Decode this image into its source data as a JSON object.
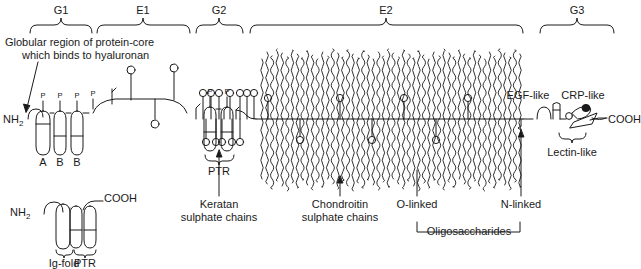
{
  "figure": {
    "type": "diagram",
    "background_color": "#ffffff",
    "line_color": "#1a1a1a"
  },
  "domain_braces": [
    {
      "label": "G1",
      "x1": 30,
      "x2": 93,
      "center": 61
    },
    {
      "label": "E1",
      "x1": 97,
      "x2": 190,
      "center": 143
    },
    {
      "label": "G2",
      "x1": 196,
      "x2": 243,
      "center": 219
    },
    {
      "label": "E2",
      "x1": 250,
      "x2": 523,
      "center": 386
    },
    {
      "label": "G3",
      "x1": 540,
      "x2": 614,
      "center": 577
    }
  ],
  "annotations": {
    "globular_note_line1": "Globular region of protein-core",
    "globular_note_line2": "which binds to hyaluronan",
    "keratan_line1": "Keratan",
    "keratan_line2": "sulphate chains",
    "chondroitin_line1": "Chondroitin",
    "chondroitin_line2": "sulphate chains",
    "o_linked": "O-linked",
    "n_linked": "N-linked",
    "oligosaccharides": "Oligosaccharides",
    "egf_like": "EGF-like",
    "crp_like": "CRP-like",
    "lectin_like": "Lectin-like"
  },
  "termini": {
    "n_terminus": "NH",
    "n_terminus_sub": "2",
    "c_terminus": "COOH"
  },
  "g1_loops": [
    {
      "label": "A",
      "x": 43
    },
    {
      "label": "B",
      "x": 60
    },
    {
      "label": "B",
      "x": 77
    }
  ],
  "ptr_labels": [
    {
      "label": "PTR",
      "x": 219,
      "y": 152
    },
    {
      "label": "PTR",
      "x": 75,
      "y": 244
    }
  ],
  "p_marks": [
    {
      "x": 43
    },
    {
      "x": 60
    },
    {
      "x": 77
    },
    {
      "x": 93
    },
    {
      "x": 210
    },
    {
      "x": 227
    }
  ],
  "inset": {
    "n_terminus": "NH",
    "n_terminus_sub": "2",
    "c_terminus": "COOH",
    "ig_fold_label": "Ig-fold",
    "ptr_label": "PTR"
  },
  "keratan_sulphate": {
    "top_stalks_x": [
      203,
      211,
      219,
      230,
      240,
      247,
      254
    ],
    "bottom_stalks_x": [
      206,
      216,
      222,
      232,
      240
    ],
    "arrow_x": 219
  },
  "chondroitin_sulphate": {
    "region_x1": 262,
    "region_x2": 520,
    "count": 52,
    "arrow_x": 340
  },
  "o_linked_marks_x": [
    268,
    300,
    340,
    372,
    404,
    436,
    468
  ],
  "callout_lines": {
    "keratan_x": 219,
    "chondroitin_x": 340,
    "o_linked_x": 417,
    "n_linked_x": 521
  }
}
